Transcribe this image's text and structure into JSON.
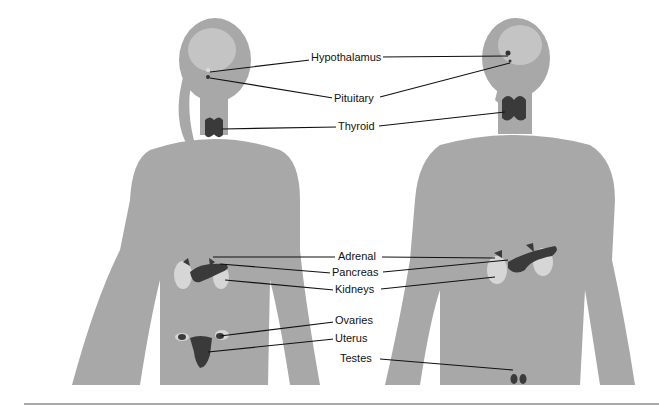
{
  "diagram": {
    "labels": {
      "hypothalamus": "Hypothalamus",
      "pituitary": "Pituitary",
      "thyroid": "Thyroid",
      "adrenal": "Adrenal",
      "pancreas": "Pancreas",
      "kidneys": "Kidneys",
      "ovaries": "Ovaries",
      "uterus": "Uterus",
      "testes": "Testes"
    },
    "colors": {
      "body": "#a8a8a8",
      "brain": "#c4c4c4",
      "gland": "#3a3a3a",
      "kidney": "#d6d6d6",
      "line": "#111111",
      "rule": "#555555"
    }
  }
}
